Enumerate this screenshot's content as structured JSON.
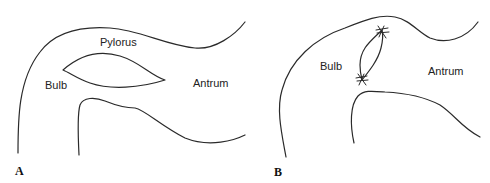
{
  "figure": {
    "panels": [
      {
        "id": "A",
        "letter": "A",
        "labels": {
          "pylorus": "Pylorus",
          "bulb": "Bulb",
          "antrum": "Antrum"
        }
      },
      {
        "id": "B",
        "letter": "B",
        "labels": {
          "bulb": "Bulb",
          "antrum": "Antrum"
        }
      }
    ],
    "colors": {
      "line": "#2a2a2a",
      "text": "#222222",
      "background": "#ffffff"
    }
  }
}
